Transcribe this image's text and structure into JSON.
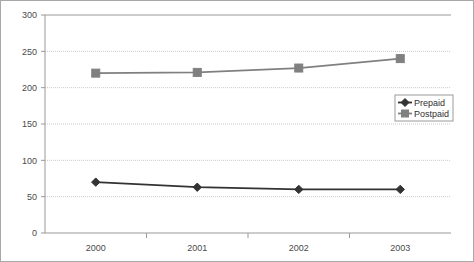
{
  "chart_data": {
    "type": "line",
    "title": "",
    "xlabel": "",
    "ylabel": "",
    "categories": [
      "2000",
      "2001",
      "2002",
      "2003"
    ],
    "ylim": [
      0,
      300
    ],
    "yticks": [
      0,
      50,
      100,
      150,
      200,
      250,
      300
    ],
    "ytick_labels": [
      "0",
      "50",
      "100",
      "150",
      "200",
      "250",
      "300"
    ],
    "grid": "horizontal-dotted",
    "legend_position": "right-middle",
    "series": [
      {
        "name": "Prepaid",
        "values": [
          70,
          63,
          60,
          60
        ],
        "color": "#333333",
        "marker": "diamond"
      },
      {
        "name": "Postpaid",
        "values": [
          220,
          221,
          227,
          240
        ],
        "color": "#808080",
        "marker": "square"
      }
    ]
  },
  "legend": {
    "entries": [
      {
        "label": "Prepaid"
      },
      {
        "label": "Postpaid"
      }
    ]
  },
  "colors": {
    "prepaid": "#333333",
    "postpaid": "#808080",
    "axis": "#999999",
    "gridline": "#c9c9c9",
    "border": "#a8a8a8",
    "tick_text": "#4a4a4a"
  }
}
